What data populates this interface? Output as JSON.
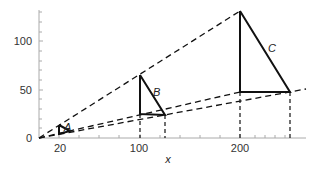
{
  "figure": {
    "x_axis": {
      "label": "x",
      "ticks": [
        "20",
        "100",
        "200"
      ]
    },
    "y_axis": {
      "ticks": [
        "0",
        "50",
        "100"
      ]
    },
    "triangles": [
      {
        "label": "A"
      },
      {
        "label": "B"
      },
      {
        "label": "C"
      }
    ]
  }
}
